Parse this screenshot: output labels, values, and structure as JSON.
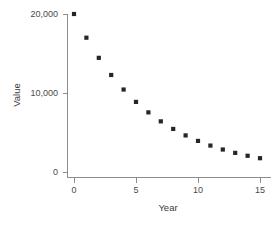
{
  "chart_data": {
    "type": "scatter",
    "title": "",
    "xlabel": "Year",
    "ylabel": "Value",
    "xlim": [
      -0.6,
      15.6
    ],
    "ylim": [
      0,
      21000
    ],
    "xticks": [
      0,
      5,
      10,
      15
    ],
    "xtick_labels": [
      "0",
      "5",
      "10",
      "15"
    ],
    "yticks": [
      0,
      10000,
      20000
    ],
    "ytick_labels": [
      "0",
      "10,000",
      "20,000"
    ],
    "grid": false,
    "legend": false,
    "marker": "square",
    "marker_color": "#262626",
    "axis_color": "#8c8c8c",
    "x": [
      0,
      1,
      2,
      3,
      4,
      5,
      6,
      7,
      8,
      9,
      10,
      11,
      12,
      13,
      14,
      15
    ],
    "values": [
      20000,
      17000,
      14450,
      12280,
      10440,
      8875,
      7545,
      6410,
      5450,
      4630,
      3935,
      3345,
      2845,
      2420,
      2055,
      1745
    ],
    "series": [
      {
        "name": "Value",
        "values": [
          20000,
          17000,
          14450,
          12280,
          10440,
          8875,
          7545,
          6410,
          5450,
          4630,
          3935,
          3345,
          2845,
          2420,
          2055,
          1745
        ]
      }
    ]
  },
  "axis": {
    "x_title": "Year",
    "y_title": "Value"
  }
}
